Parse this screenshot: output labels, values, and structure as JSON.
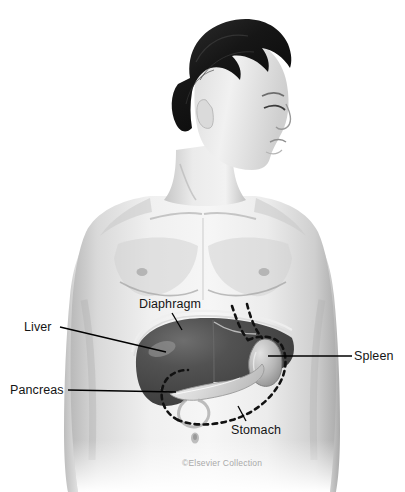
{
  "figure": {
    "kind": "anatomical-illustration",
    "style": "grayscale medical illustration with semi-transparent abdominal organ overlay",
    "background_color": "#ffffff"
  },
  "labels": [
    {
      "id": "liver",
      "text": "Liver",
      "leader": "horizontal line from label right edge to liver mass"
    },
    {
      "id": "pancreas",
      "text": "Pancreas",
      "leader": "horizontal line from label right edge to pancreas"
    },
    {
      "id": "diaphragm",
      "text": "Diaphragm",
      "leader": "short diagonal line down-right to diaphragm arcs"
    },
    {
      "id": "spleen",
      "text": "Spleen",
      "leader": "horizontal line from label left edge to spleen"
    },
    {
      "id": "stomach",
      "text": "Stomach",
      "leader": "short diagonal line up-left to dashed stomach outline"
    }
  ],
  "organs": [
    {
      "id": "liver",
      "rendering": "solid dark gray mass with specular highlight",
      "color": "#4c4c4c"
    },
    {
      "id": "spleen",
      "rendering": "curved light gray oval, right upper quadrant",
      "color": "#bdbdbd"
    },
    {
      "id": "pancreas",
      "rendering": "light tapering elongated body",
      "color": "#dcdcdc"
    },
    {
      "id": "diaphragm",
      "rendering": "thin nested arc lines over the liver dome",
      "color": "#e8e8e8"
    },
    {
      "id": "stomach",
      "rendering": "large J-shaped dashed black outline",
      "color": "#111111"
    }
  ],
  "credit": {
    "text": "©Elsevier Collection",
    "color": "#a9a9a9"
  },
  "palette": {
    "skin_light": "#f2f2f2",
    "skin_mid": "#d6d6d6",
    "skin_shadow": "#a8a8a8",
    "hair": "#121212",
    "label_text": "#151515",
    "leader_line": "#000000"
  }
}
